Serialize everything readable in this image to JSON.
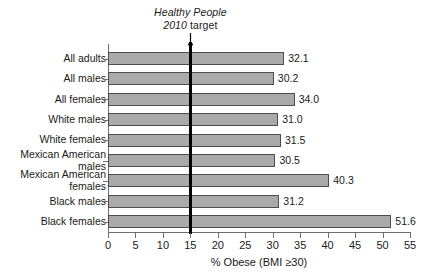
{
  "chart_data": {
    "type": "bar",
    "orientation": "horizontal",
    "title": "",
    "xlabel": "% Obese (BMI ≥30)",
    "ylabel": "",
    "xlim": [
      0,
      55
    ],
    "xticks": [
      0,
      5,
      10,
      15,
      20,
      25,
      30,
      35,
      40,
      45,
      50,
      55
    ],
    "grid": false,
    "legend": null,
    "categories": [
      "All adults",
      "All males",
      "All females",
      "White males",
      "White females",
      "Mexican American males",
      "Mexican American females",
      "Black males",
      "Black females"
    ],
    "category_lines": [
      [
        "All adults"
      ],
      [
        "All males"
      ],
      [
        "All females"
      ],
      [
        "White males"
      ],
      [
        "White females"
      ],
      [
        "Mexican American",
        "males"
      ],
      [
        "Mexican American",
        "females"
      ],
      [
        "Black males"
      ],
      [
        "Black females"
      ]
    ],
    "values": [
      32.1,
      30.2,
      34.0,
      31.0,
      31.5,
      30.5,
      40.3,
      31.2,
      51.6
    ],
    "value_labels": [
      "32.1",
      "30.2",
      "34.0",
      "31.0",
      "31.5",
      "30.5",
      "40.3",
      "31.2",
      "51.6"
    ],
    "annotations": [
      {
        "name": "healthy-people-target",
        "line1": "Healthy People",
        "line2_italic": "2010",
        "line2_rest": " target",
        "value": 15,
        "marker": "vertical-line-with-arrow"
      }
    ],
    "colors": {
      "bar_fill": "#aaaaaa",
      "bar_border": "#4d4d4d",
      "axis": "#6e6e6e",
      "target_line": "#000000",
      "text": "#1a1a1a",
      "background": "#ffffff"
    }
  }
}
